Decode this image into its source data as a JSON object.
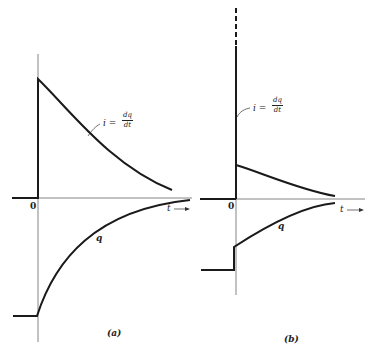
{
  "panels": [
    {
      "id": "a",
      "caption": "(a)",
      "origin_label": "0",
      "time_axis_label": "t",
      "current_label": {
        "lhs": "i =",
        "num": "dq",
        "den": "dt"
      },
      "charge_label": "q"
    },
    {
      "id": "b",
      "caption": "(b)",
      "origin_label": "0",
      "time_axis_label": "t",
      "current_label": {
        "lhs": "i =",
        "num": "dq",
        "den": "dt"
      },
      "charge_label": "q"
    }
  ],
  "colors": {
    "ink": "#1a1a1a",
    "axis": "#555555",
    "background": "#ffffff"
  }
}
